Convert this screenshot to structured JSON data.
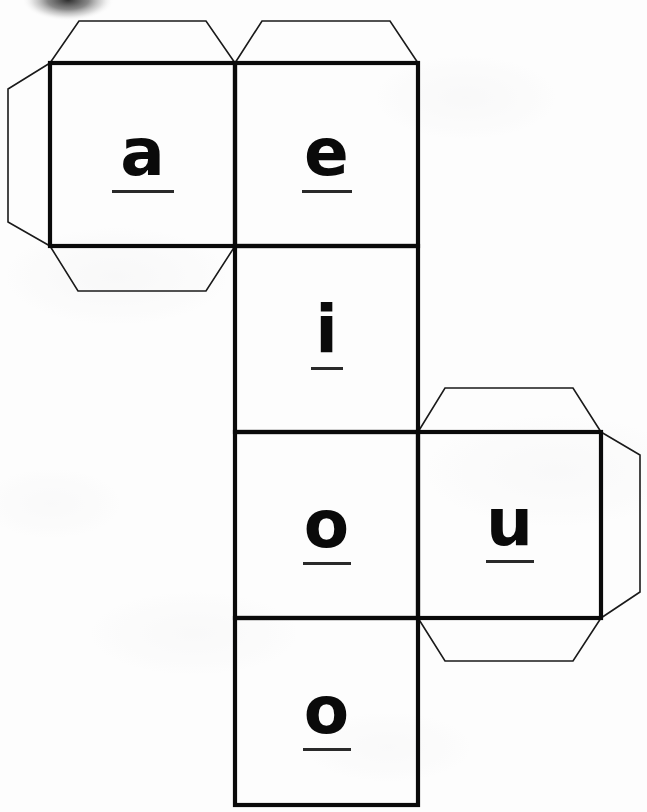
{
  "document": {
    "title": "Cube Net — Vowel Dice Template",
    "kind": "cube-net-cut-out",
    "background_color": "#fdfdfd",
    "ink_color": "#0a0a0a",
    "flap_line_color": "#1a1a1a"
  },
  "faces": [
    {
      "id": "face-a",
      "letter": "a",
      "row": 1,
      "column": 1,
      "x": 50,
      "y": 63,
      "size": 185
    },
    {
      "id": "face-e",
      "letter": "e",
      "row": 1,
      "column": 2,
      "x": 235,
      "y": 63,
      "size": 183
    },
    {
      "id": "face-i",
      "letter": "i",
      "row": 2,
      "column": 2,
      "x": 235,
      "y": 246,
      "size": 183
    },
    {
      "id": "face-o1",
      "letter": "o",
      "row": 3,
      "column": 2,
      "x": 235,
      "y": 432,
      "size": 183
    },
    {
      "id": "face-u",
      "letter": "u",
      "row": 3,
      "column": 3,
      "x": 418,
      "y": 432,
      "size": 183
    },
    {
      "id": "face-o2",
      "letter": "o",
      "row": 4,
      "column": 2,
      "x": 235,
      "y": 619,
      "size": 186
    }
  ],
  "flaps": [
    {
      "id": "flap-top-a",
      "edge": "top",
      "attached_to": "face-a"
    },
    {
      "id": "flap-left-a",
      "edge": "left",
      "attached_to": "face-a"
    },
    {
      "id": "flap-bottom-a",
      "edge": "bottom",
      "attached_to": "face-a"
    },
    {
      "id": "flap-top-e",
      "edge": "top",
      "attached_to": "face-e"
    },
    {
      "id": "flap-top-u",
      "edge": "top",
      "attached_to": "face-u"
    },
    {
      "id": "flap-right-u",
      "edge": "right",
      "attached_to": "face-u"
    },
    {
      "id": "flap-bottom-u",
      "edge": "bottom",
      "attached_to": "face-u"
    }
  ],
  "smudge": {
    "present": true,
    "description": "dark scanner smudge at top edge",
    "x": 22,
    "y": -14,
    "width": 92,
    "height": 34
  },
  "letters": {
    "a": "a",
    "e": "e",
    "i": "i",
    "o_upper": "o",
    "u": "u",
    "o_lower": "o"
  }
}
